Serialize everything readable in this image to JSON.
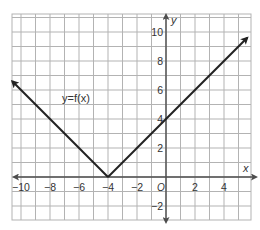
{
  "chart_data": {
    "type": "line",
    "title": "",
    "function_label": "y=f(x)",
    "xlabel": "x",
    "ylabel": "y",
    "origin_label": "O",
    "xlim": [
      -10.6,
      5.9
    ],
    "ylim": [
      -3.0,
      11.2
    ],
    "grid": true,
    "x_ticks": [
      -10,
      -8,
      -6,
      -4,
      -2,
      2,
      4
    ],
    "x_tick_labels": [
      "−10",
      "−8",
      "−6",
      "−4",
      "−2",
      "2",
      "4"
    ],
    "y_ticks": [
      10,
      8,
      6,
      4,
      2,
      -2
    ],
    "y_tick_labels": [
      "10",
      "8",
      "6",
      "4",
      "2",
      "−2"
    ],
    "series": [
      {
        "name": "y=f(x)",
        "description": "Absolute value graph with vertex at (-4, 0)",
        "x": [
          -10.6,
          -4,
          5.6
        ],
        "y": [
          6.6,
          0,
          9.6
        ],
        "arrows": "both"
      }
    ],
    "vertex": [
      -4,
      0
    ],
    "y_intercept": 4,
    "colors": {
      "grid": "#b3b3b3",
      "axis": "#4d4d4d",
      "line": "#222222"
    }
  }
}
